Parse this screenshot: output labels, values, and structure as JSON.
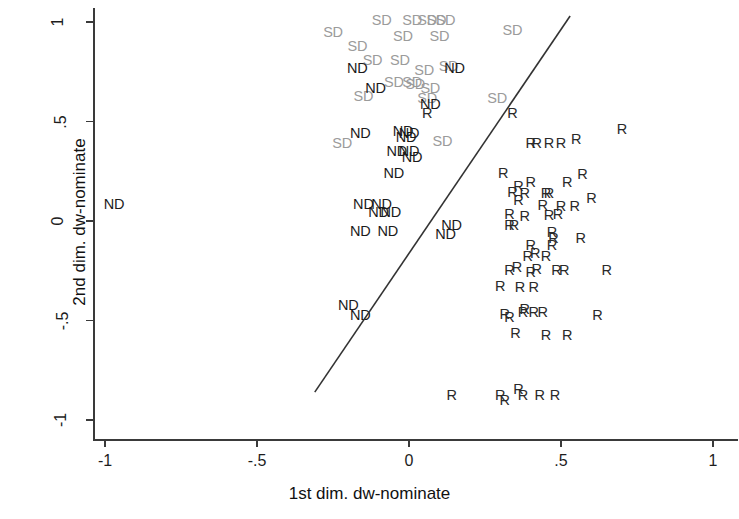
{
  "chart_data": {
    "type": "scatter",
    "title": "",
    "xlabel": "1st dim. dw-nominate",
    "ylabel": "2nd dim. dw-nominate",
    "xlim": [
      -1,
      1
    ],
    "ylim": [
      -1,
      1
    ],
    "xticks": [
      "-1",
      "-.5",
      "0",
      ".5",
      "1"
    ],
    "xtickvals": [
      -1,
      -0.5,
      0,
      0.5,
      1
    ],
    "yticks": [
      "1",
      ".5",
      "0",
      "-.5",
      "-1"
    ],
    "ytickvals": [
      1,
      0.5,
      0,
      -0.5,
      -1
    ],
    "grid": false,
    "legend": "none",
    "marker_style": "text-labels",
    "annotation_line": {
      "label": "separating-line",
      "x0": -0.31,
      "y0": -0.86,
      "x1": 0.53,
      "y1": 1.03,
      "color": "#333333"
    },
    "series": [
      {
        "name": "SD",
        "label": "SD",
        "color": "#9b9b9b",
        "points": [
          [
            -0.09,
            1.01
          ],
          [
            0.01,
            1.01
          ],
          [
            0.06,
            1.01
          ],
          [
            0.09,
            1.01
          ],
          [
            0.12,
            1.01
          ],
          [
            -0.25,
            0.95
          ],
          [
            0.34,
            0.96
          ],
          [
            -0.02,
            0.93
          ],
          [
            0.1,
            0.93
          ],
          [
            -0.17,
            0.88
          ],
          [
            -0.12,
            0.81
          ],
          [
            -0.03,
            0.81
          ],
          [
            0.05,
            0.76
          ],
          [
            0.13,
            0.78
          ],
          [
            -0.05,
            0.7
          ],
          [
            0.01,
            0.7
          ],
          [
            0.02,
            0.69
          ],
          [
            0.07,
            0.67
          ],
          [
            -0.15,
            0.63
          ],
          [
            0.06,
            0.62
          ],
          [
            0.29,
            0.62
          ],
          [
            -0.22,
            0.39
          ],
          [
            0.11,
            0.4
          ]
        ]
      },
      {
        "name": "ND",
        "label": "ND",
        "color": "#1b1b1b",
        "points": [
          [
            -0.97,
            0.085
          ],
          [
            -0.17,
            0.77
          ],
          [
            0.15,
            0.77
          ],
          [
            -0.11,
            0.67
          ],
          [
            0.07,
            0.59
          ],
          [
            -0.16,
            0.44
          ],
          [
            -0.02,
            0.45
          ],
          [
            0.0,
            0.44
          ],
          [
            -0.01,
            0.42
          ],
          [
            -0.04,
            0.35
          ],
          [
            0.0,
            0.35
          ],
          [
            0.01,
            0.32
          ],
          [
            -0.05,
            0.24
          ],
          [
            -0.15,
            0.085
          ],
          [
            -0.09,
            0.085
          ],
          [
            -0.1,
            0.045
          ],
          [
            -0.06,
            0.045
          ],
          [
            -0.16,
            -0.05
          ],
          [
            -0.07,
            -0.05
          ],
          [
            0.14,
            -0.02
          ],
          [
            0.12,
            -0.065
          ],
          [
            -0.2,
            -0.42
          ],
          [
            -0.16,
            -0.47
          ]
        ]
      },
      {
        "name": "R",
        "label": "R",
        "color": "#2a2a2a",
        "points": [
          [
            0.7,
            0.46
          ],
          [
            0.4,
            0.39
          ],
          [
            0.42,
            0.39
          ],
          [
            0.46,
            0.39
          ],
          [
            0.5,
            0.39
          ],
          [
            0.55,
            0.41
          ],
          [
            0.34,
            0.545
          ],
          [
            0.06,
            0.545
          ],
          [
            0.31,
            0.24
          ],
          [
            0.36,
            0.175
          ],
          [
            0.4,
            0.195
          ],
          [
            0.34,
            0.145
          ],
          [
            0.38,
            0.14
          ],
          [
            0.45,
            0.14
          ],
          [
            0.46,
            0.14
          ],
          [
            0.52,
            0.195
          ],
          [
            0.57,
            0.235
          ],
          [
            0.36,
            0.105
          ],
          [
            0.44,
            0.08
          ],
          [
            0.5,
            0.075
          ],
          [
            0.545,
            0.075
          ],
          [
            0.6,
            0.115
          ],
          [
            0.33,
            0.035
          ],
          [
            0.38,
            0.025
          ],
          [
            0.46,
            0.03
          ],
          [
            0.49,
            0.035
          ],
          [
            0.33,
            -0.02
          ],
          [
            0.345,
            -0.02
          ],
          [
            0.47,
            -0.055
          ],
          [
            0.475,
            -0.085
          ],
          [
            0.4,
            -0.12
          ],
          [
            0.47,
            -0.12
          ],
          [
            0.565,
            -0.085
          ],
          [
            0.39,
            -0.175
          ],
          [
            0.415,
            -0.16
          ],
          [
            0.45,
            -0.175
          ],
          [
            0.355,
            -0.23
          ],
          [
            0.33,
            -0.245
          ],
          [
            0.4,
            -0.255
          ],
          [
            0.42,
            -0.24
          ],
          [
            0.485,
            -0.245
          ],
          [
            0.51,
            -0.245
          ],
          [
            0.65,
            -0.245
          ],
          [
            0.3,
            -0.325
          ],
          [
            0.365,
            -0.33
          ],
          [
            0.41,
            -0.33
          ],
          [
            0.38,
            -0.44
          ],
          [
            0.375,
            -0.455
          ],
          [
            0.41,
            -0.455
          ],
          [
            0.44,
            -0.455
          ],
          [
            0.315,
            -0.465
          ],
          [
            0.33,
            -0.48
          ],
          [
            0.62,
            -0.47
          ],
          [
            0.35,
            -0.565
          ],
          [
            0.45,
            -0.575
          ],
          [
            0.52,
            -0.575
          ],
          [
            0.14,
            -0.875
          ],
          [
            0.3,
            -0.875
          ],
          [
            0.315,
            -0.9
          ],
          [
            0.36,
            -0.845
          ],
          [
            0.375,
            -0.875
          ],
          [
            0.43,
            -0.875
          ],
          [
            0.48,
            -0.875
          ]
        ]
      }
    ]
  }
}
